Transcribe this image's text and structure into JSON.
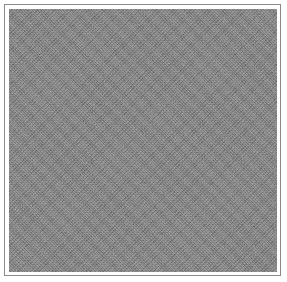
{
  "image": {
    "description": "grayscale random noise texture",
    "frame_color": "#8a8a8a",
    "noise_base_color": "#6e6e6e",
    "background_color": "#ffffff"
  }
}
